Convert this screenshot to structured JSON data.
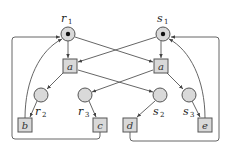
{
  "diagram": {
    "type": "petri-net",
    "colors": {
      "node_fill": "#d9d9d9",
      "stroke": "#555555",
      "token": "#111111",
      "background": "#ffffff"
    },
    "places": [
      {
        "id": "r1",
        "label": "r",
        "sub": "1",
        "x": 68,
        "y": 34,
        "token": true
      },
      {
        "id": "s1",
        "label": "s",
        "sub": "1",
        "x": 163,
        "y": 34,
        "token": true
      },
      {
        "id": "r2",
        "label": "r",
        "sub": "2",
        "x": 41,
        "y": 95,
        "token": false
      },
      {
        "id": "r3",
        "label": "r",
        "sub": "3",
        "x": 85,
        "y": 95,
        "token": false
      },
      {
        "id": "s2",
        "label": "s",
        "sub": "2",
        "x": 160,
        "y": 95,
        "token": false
      },
      {
        "id": "s3",
        "label": "s",
        "sub": "3",
        "x": 189,
        "y": 95,
        "token": false
      }
    ],
    "transitions": [
      {
        "id": "a_left",
        "label": "a",
        "x": 70,
        "y": 66
      },
      {
        "id": "a_right",
        "label": "a",
        "x": 160,
        "y": 66
      },
      {
        "id": "b",
        "label": "b",
        "x": 25,
        "y": 125
      },
      {
        "id": "c",
        "label": "c",
        "x": 100,
        "y": 125
      },
      {
        "id": "d",
        "label": "d",
        "x": 130,
        "y": 125
      },
      {
        "id": "e",
        "label": "e",
        "x": 205,
        "y": 125
      }
    ],
    "arcs": [
      {
        "from": "r1",
        "to": "a_left"
      },
      {
        "from": "r1",
        "to": "a_right"
      },
      {
        "from": "s1",
        "to": "a_left"
      },
      {
        "from": "s1",
        "to": "a_right"
      },
      {
        "from": "a_left",
        "to": "r2"
      },
      {
        "from": "a_left",
        "to": "s2"
      },
      {
        "from": "a_right",
        "to": "r3"
      },
      {
        "from": "a_right",
        "to": "s3"
      },
      {
        "from": "r2",
        "to": "b"
      },
      {
        "from": "r3",
        "to": "c"
      },
      {
        "from": "s2",
        "to": "d"
      },
      {
        "from": "s3",
        "to": "e"
      },
      {
        "from": "b",
        "to": "r1"
      },
      {
        "from": "c",
        "to": "r1"
      },
      {
        "from": "d",
        "to": "s1"
      },
      {
        "from": "e",
        "to": "s1"
      }
    ]
  }
}
